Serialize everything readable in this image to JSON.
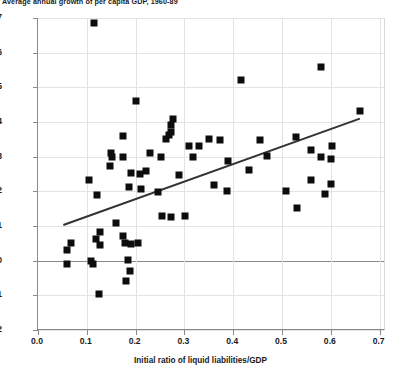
{
  "chart_data": {
    "type": "scatter",
    "title": "Average annual growth of per capita GDP, 1960-89",
    "xlabel": "Initial ratio of liquid liabilities/GDP",
    "ylabel": "",
    "xlim": [
      0.0,
      0.713
    ],
    "ylim": [
      -0.02,
      0.07
    ],
    "grid": true,
    "legend": "none",
    "xticks": [
      "0.0",
      "0.1",
      "0.2",
      "0.3",
      "0.4",
      "0.5",
      "0.6",
      "0.7"
    ],
    "xtick_values": [
      0.0,
      0.1,
      0.2,
      0.3,
      0.4,
      0.5,
      0.6,
      0.7
    ],
    "yticks": [
      "0.07",
      "0.06",
      "0.05",
      "0.04",
      "0.03",
      "0.02",
      "0.01",
      "0.00",
      "-0.01",
      "-0.02"
    ],
    "ytick_values": [
      0.07,
      0.06,
      0.05,
      0.04,
      0.03,
      0.02,
      0.01,
      0.0,
      -0.01,
      -0.02
    ],
    "marker": "square",
    "marker_color": "#0d0d0d",
    "points": [
      [
        0.115,
        0.0685
      ],
      [
        0.2,
        0.046
      ],
      [
        0.415,
        0.052
      ],
      [
        0.58,
        0.056
      ],
      [
        0.66,
        0.0432
      ],
      [
        0.277,
        0.0408
      ],
      [
        0.272,
        0.0392
      ],
      [
        0.272,
        0.0372
      ],
      [
        0.268,
        0.0362
      ],
      [
        0.262,
        0.0352
      ],
      [
        0.175,
        0.036
      ],
      [
        0.35,
        0.0352
      ],
      [
        0.372,
        0.0348
      ],
      [
        0.31,
        0.0332
      ],
      [
        0.33,
        0.033
      ],
      [
        0.455,
        0.0348
      ],
      [
        0.528,
        0.0358
      ],
      [
        0.602,
        0.0332
      ],
      [
        0.15,
        0.0312
      ],
      [
        0.152,
        0.03
      ],
      [
        0.175,
        0.03
      ],
      [
        0.23,
        0.0312
      ],
      [
        0.252,
        0.03
      ],
      [
        0.56,
        0.032
      ],
      [
        0.58,
        0.03
      ],
      [
        0.318,
        0.03
      ],
      [
        0.6,
        0.0292
      ],
      [
        0.148,
        0.0272
      ],
      [
        0.39,
        0.0288
      ],
      [
        0.104,
        0.0232
      ],
      [
        0.19,
        0.0252
      ],
      [
        0.21,
        0.025
      ],
      [
        0.222,
        0.0258
      ],
      [
        0.288,
        0.0248
      ],
      [
        0.432,
        0.0262
      ],
      [
        0.47,
        0.0302
      ],
      [
        0.56,
        0.0232
      ],
      [
        0.6,
        0.0222
      ],
      [
        0.12,
        0.0188
      ],
      [
        0.186,
        0.0212
      ],
      [
        0.212,
        0.0206
      ],
      [
        0.36,
        0.0218
      ],
      [
        0.388,
        0.02
      ],
      [
        0.508,
        0.0202
      ],
      [
        0.588,
        0.0192
      ],
      [
        0.245,
        0.0198
      ],
      [
        0.255,
        0.013
      ],
      [
        0.272,
        0.0126
      ],
      [
        0.302,
        0.0128
      ],
      [
        0.53,
        0.0152
      ],
      [
        0.068,
        0.0052
      ],
      [
        0.128,
        0.0045
      ],
      [
        0.178,
        0.005
      ],
      [
        0.19,
        0.0048
      ],
      [
        0.205,
        0.0052
      ],
      [
        0.175,
        0.007
      ],
      [
        0.06,
        0.0032
      ],
      [
        0.108,
        0.0
      ],
      [
        0.112,
        -0.001
      ],
      [
        0.06,
        -0.001
      ],
      [
        0.185,
        0.0002
      ],
      [
        0.188,
        -0.003
      ],
      [
        0.125,
        -0.0095
      ],
      [
        0.18,
        -0.0058
      ],
      [
        0.118,
        0.0062
      ],
      [
        0.128,
        0.0082
      ],
      [
        0.16,
        0.0108
      ]
    ],
    "trendline": {
      "x0": 0.052,
      "y0": 0.0105,
      "x1": 0.66,
      "y1": 0.0412,
      "color": "#333333"
    }
  }
}
